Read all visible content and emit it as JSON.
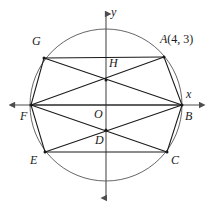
{
  "figure": {
    "name": "circle-with-inscribed-chords-diagram",
    "width": 217,
    "height": 213,
    "stroke_color": "#1a1a1a",
    "axis_color": "#4d4d4d",
    "circle_color": "#555555",
    "background": "#ffffff"
  },
  "axes": {
    "x_label": "x",
    "y_label": "y",
    "origin_label": "O",
    "x_axis": {
      "x1": 8,
      "y1": 105,
      "x2": 205,
      "y2": 105
    },
    "y_axis": {
      "x1": 106,
      "y1": 8,
      "x2": 106,
      "y2": 203
    }
  },
  "circle": {
    "center_x": 106,
    "center_y": 105,
    "radius": 76
  },
  "points": [
    {
      "id": "A",
      "label": "A",
      "annotation": "(4, 3)",
      "x": 164,
      "y": 57,
      "label_x": 163,
      "label_y": 40
    },
    {
      "id": "B",
      "label": "B",
      "annotation": "",
      "x": 182,
      "y": 105,
      "label_x": 186,
      "label_y": 112
    },
    {
      "id": "C",
      "label": "C",
      "annotation": "",
      "x": 167,
      "y": 152,
      "label_x": 172,
      "label_y": 156
    },
    {
      "id": "D",
      "label": "D",
      "annotation": "",
      "x": 106,
      "y": 130,
      "label_x": 96,
      "label_y": 136
    },
    {
      "id": "E",
      "label": "E",
      "annotation": "",
      "x": 45,
      "y": 152,
      "label_x": 31,
      "label_y": 156
    },
    {
      "id": "F",
      "label": "F",
      "annotation": "",
      "x": 31,
      "y": 105,
      "label_x": 21,
      "label_y": 112
    },
    {
      "id": "G",
      "label": "G",
      "annotation": "",
      "x": 44,
      "y": 58,
      "label_x": 33,
      "label_y": 41
    },
    {
      "id": "H",
      "label": "H",
      "annotation": "",
      "x": 106,
      "y": 80,
      "label_x": 110,
      "label_y": 61
    }
  ],
  "segments": [
    {
      "from": "G",
      "to": "A",
      "name": "segment-g-a"
    },
    {
      "from": "G",
      "to": "B",
      "name": "segment-g-b"
    },
    {
      "from": "G",
      "to": "F",
      "name": "segment-g-f"
    },
    {
      "from": "A",
      "to": "F",
      "name": "segment-a-f"
    },
    {
      "from": "A",
      "to": "B",
      "name": "segment-a-b"
    },
    {
      "from": "F",
      "to": "B",
      "name": "segment-f-b"
    },
    {
      "from": "F",
      "to": "C",
      "name": "segment-f-c"
    },
    {
      "from": "F",
      "to": "E",
      "name": "segment-f-e"
    },
    {
      "from": "E",
      "to": "B",
      "name": "segment-e-b"
    },
    {
      "from": "E",
      "to": "C",
      "name": "segment-e-c"
    },
    {
      "from": "C",
      "to": "B",
      "name": "segment-c-b"
    }
  ],
  "labels": {
    "a_point": "A",
    "a_coords": "(4, 3)",
    "b_point": "B",
    "c_point": "C",
    "d_point": "D",
    "e_point": "E",
    "f_point": "F",
    "g_point": "G",
    "h_point": "H",
    "origin": "O",
    "x_axis": "x",
    "y_axis": "y"
  }
}
